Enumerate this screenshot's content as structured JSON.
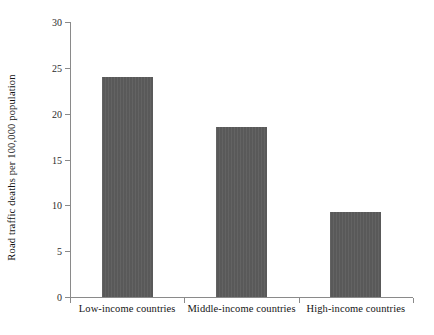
{
  "chart_data": {
    "type": "bar",
    "title": "",
    "subtitle": "",
    "xlabel": "",
    "ylabel": "Road traffic deaths per 100,000 population",
    "categories": [
      "Low-income countries",
      "Middle-income countries",
      "High-income countries"
    ],
    "values": [
      24.0,
      18.5,
      9.3
    ],
    "ylim": [
      0,
      30
    ],
    "yticks": [
      0,
      5,
      10,
      15,
      20,
      25,
      30
    ],
    "ytick_labels": [
      "0",
      "5",
      "10",
      "15",
      "20",
      "25",
      "30"
    ],
    "grid": false,
    "legend": null,
    "legend_position": "none",
    "bar_color": "#5c5c5c",
    "axis_color": "#8a8a8a",
    "background_color": "#ffffff",
    "annotations": []
  }
}
